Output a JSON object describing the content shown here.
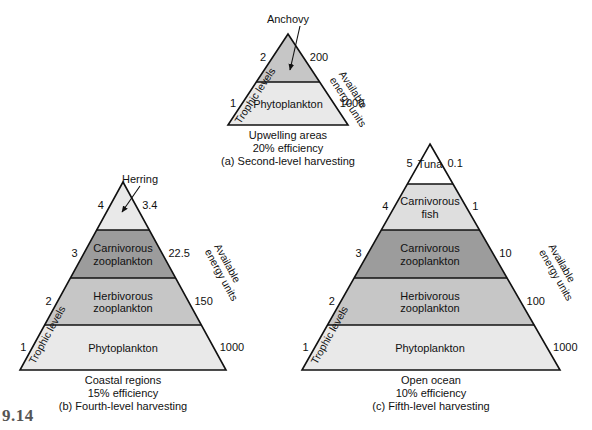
{
  "figure": {
    "title_fragment": "9.14",
    "background": "#ffffff",
    "ink": "#111111"
  },
  "palette": {
    "white": "#ffffff",
    "light": "#e9e9e9",
    "pale": "#dedede",
    "mid": "#c6c6c6",
    "dark": "#9c9c9c",
    "outline": "#111111"
  },
  "axis_labels": {
    "trophic": "Trophic levels",
    "energy": "Available\nenergy units",
    "energy_line1": "Available",
    "energy_line2": "energy units"
  },
  "pyramids": [
    {
      "id": "a",
      "geometry": {
        "apex_x": 288,
        "apex_y": 34,
        "base_left_x": 228,
        "base_right_x": 348,
        "base_y": 125
      },
      "callout": {
        "label": "Anchovy",
        "x": 288,
        "y": 13,
        "arrow_from_x": 300,
        "arrow_from_y": 26,
        "arrow_to_x": 290,
        "arrow_to_y": 70
      },
      "levels": [
        {
          "trophic": "2",
          "name": "",
          "energy": "200",
          "fill": "#c6c6c6",
          "top_y": 34,
          "bottom_y": 82
        },
        {
          "trophic": "1",
          "name": "Phytoplankton",
          "energy": "1000",
          "fill": "#e9e9e9",
          "top_y": 82,
          "bottom_y": 125
        }
      ],
      "caption": {
        "region": "Upwelling areas",
        "efficiency": "20% efficiency",
        "label": "(a) Second-level harvesting"
      }
    },
    {
      "id": "b",
      "geometry": {
        "apex_x": 123,
        "apex_y": 182,
        "base_left_x": 20,
        "base_right_x": 226,
        "base_y": 370
      },
      "callout": {
        "label": "Herring",
        "x": 140,
        "y": 173,
        "arrow_from_x": 140,
        "arrow_from_y": 186,
        "arrow_to_x": 122,
        "arrow_to_y": 212
      },
      "levels": [
        {
          "trophic": "4",
          "name": "",
          "energy": "3.4",
          "fill": "#e9e9e9",
          "top_y": 182,
          "bottom_y": 230
        },
        {
          "trophic": "3",
          "name": "Carnivorous\nzooplankton",
          "energy": "22.5",
          "fill": "#9c9c9c",
          "top_y": 230,
          "bottom_y": 278
        },
        {
          "trophic": "2",
          "name": "Herbivorous\nzooplankton",
          "energy": "150",
          "fill": "#c6c6c6",
          "top_y": 278,
          "bottom_y": 325
        },
        {
          "trophic": "1",
          "name": "Phytoplankton",
          "energy": "1000",
          "fill": "#e9e9e9",
          "top_y": 325,
          "bottom_y": 370
        }
      ],
      "caption": {
        "region": "Coastal regions",
        "efficiency": "15% efficiency",
        "label": "(b) Fourth-level harvesting"
      }
    },
    {
      "id": "c",
      "geometry": {
        "apex_x": 430,
        "apex_y": 144,
        "base_left_x": 302,
        "base_right_x": 560,
        "base_y": 370
      },
      "callout": null,
      "levels": [
        {
          "trophic": "5",
          "name": "Tuna",
          "energy": "0.1",
          "fill": "#ffffff",
          "top_y": 144,
          "bottom_y": 184
        },
        {
          "trophic": "4",
          "name": "Carnivorous\nfish",
          "energy": "1",
          "fill": "#dedede",
          "top_y": 184,
          "bottom_y": 230
        },
        {
          "trophic": "3",
          "name": "Carnivorous\nzooplankton",
          "energy": "10",
          "fill": "#9c9c9c",
          "top_y": 230,
          "bottom_y": 278
        },
        {
          "trophic": "2",
          "name": "Herbivorous\nzooplankton",
          "energy": "100",
          "fill": "#c6c6c6",
          "top_y": 278,
          "bottom_y": 325
        },
        {
          "trophic": "1",
          "name": "Phytoplankton",
          "energy": "1000",
          "fill": "#e9e9e9",
          "top_y": 325,
          "bottom_y": 370
        }
      ],
      "caption": {
        "region": "Open ocean",
        "efficiency": "10% efficiency",
        "label": "(c) Fifth-level harvesting"
      }
    }
  ]
}
